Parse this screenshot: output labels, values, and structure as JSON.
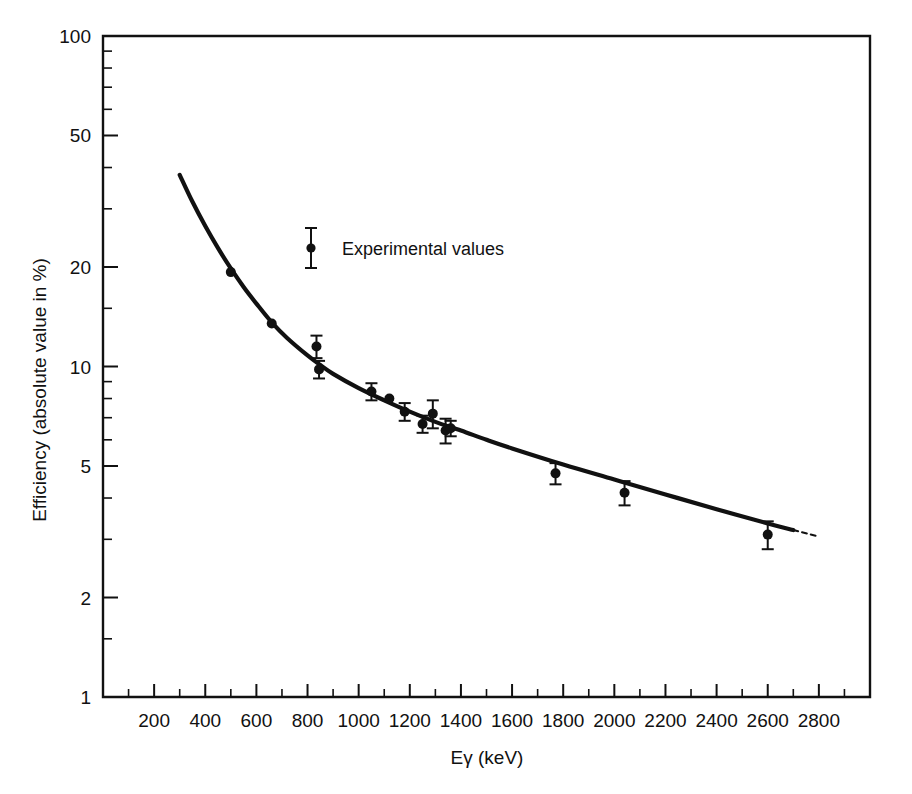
{
  "chart_data": {
    "type": "scatter",
    "title": "",
    "xlabel": "Eγ (keV)",
    "ylabel": "Efficiency (absolute value in %)",
    "xscale": "linear",
    "yscale": "log",
    "xlim": [
      0,
      3000
    ],
    "ylim": [
      1,
      100
    ],
    "grid": false,
    "legend_position": "upper-left-inside",
    "legend": [
      {
        "label": "Experimental values",
        "marker": "filled-circle-with-errorbar"
      }
    ],
    "xticks": [
      200,
      400,
      600,
      800,
      1000,
      1200,
      1400,
      1600,
      1800,
      2000,
      2200,
      2400,
      2600,
      2800
    ],
    "xticklabels": [
      "200",
      "400",
      "600",
      "800",
      "1000",
      "1200",
      "1400",
      "1600",
      "1800",
      "2000",
      "2200",
      "2400",
      "2600",
      "2800"
    ],
    "xminorticks": [
      100,
      300,
      500,
      700,
      900,
      1100,
      1300,
      1500,
      1700,
      1900,
      2100,
      2300,
      2500,
      2700,
      2900
    ],
    "yticks": [
      1,
      2,
      5,
      10,
      20,
      50,
      100
    ],
    "yticklabels": [
      "1",
      "2",
      "5",
      "10",
      "20",
      "50",
      "100"
    ],
    "yminorticks": [
      1.5,
      3,
      4,
      6,
      7,
      8,
      9,
      15,
      30,
      40,
      60,
      70,
      80,
      90
    ],
    "series": [
      {
        "name": "Experimental values",
        "marker": "filled-circle",
        "points": [
          {
            "x": 500,
            "y": 19.3,
            "yerr": 0.0
          },
          {
            "x": 660,
            "y": 13.5,
            "yerr": 0.0
          },
          {
            "x": 835,
            "y": 11.5,
            "yerr": 0.9
          },
          {
            "x": 845,
            "y": 9.8,
            "yerr": 0.6
          },
          {
            "x": 1050,
            "y": 8.4,
            "yerr": 0.5
          },
          {
            "x": 1120,
            "y": 8.0,
            "yerr": 0.0
          },
          {
            "x": 1180,
            "y": 7.3,
            "yerr": 0.45
          },
          {
            "x": 1250,
            "y": 6.7,
            "yerr": 0.4
          },
          {
            "x": 1290,
            "y": 7.2,
            "yerr": 0.7
          },
          {
            "x": 1340,
            "y": 6.4,
            "yerr": 0.55
          },
          {
            "x": 1360,
            "y": 6.5,
            "yerr": 0.35
          },
          {
            "x": 1770,
            "y": 4.75,
            "yerr": 0.35
          },
          {
            "x": 2040,
            "y": 4.15,
            "yerr": 0.35
          },
          {
            "x": 2600,
            "y": 3.1,
            "yerr": 0.3
          }
        ]
      },
      {
        "name": "Fitted efficiency curve",
        "marker": "line",
        "points": [
          {
            "x": 300,
            "y": 38.0
          },
          {
            "x": 350,
            "y": 31.5
          },
          {
            "x": 400,
            "y": 26.6
          },
          {
            "x": 450,
            "y": 22.8
          },
          {
            "x": 500,
            "y": 19.8
          },
          {
            "x": 550,
            "y": 17.4
          },
          {
            "x": 600,
            "y": 15.5
          },
          {
            "x": 660,
            "y": 13.6
          },
          {
            "x": 720,
            "y": 12.2
          },
          {
            "x": 800,
            "y": 10.8
          },
          {
            "x": 850,
            "y": 10.1
          },
          {
            "x": 900,
            "y": 9.5
          },
          {
            "x": 1000,
            "y": 8.6
          },
          {
            "x": 1100,
            "y": 7.9
          },
          {
            "x": 1200,
            "y": 7.3
          },
          {
            "x": 1300,
            "y": 6.8
          },
          {
            "x": 1400,
            "y": 6.4
          },
          {
            "x": 1500,
            "y": 6.0
          },
          {
            "x": 1600,
            "y": 5.65
          },
          {
            "x": 1800,
            "y": 5.05
          },
          {
            "x": 2000,
            "y": 4.55
          },
          {
            "x": 2200,
            "y": 4.1
          },
          {
            "x": 2400,
            "y": 3.7
          },
          {
            "x": 2600,
            "y": 3.35
          },
          {
            "x": 2700,
            "y": 3.2
          }
        ]
      }
    ]
  }
}
